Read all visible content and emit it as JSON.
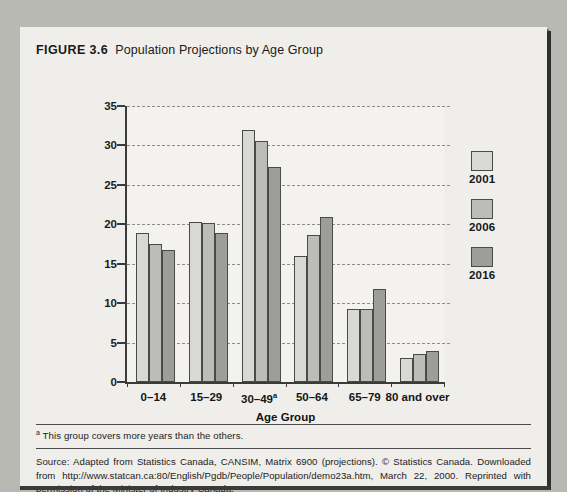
{
  "figure": {
    "number": "FIGURE 3.6",
    "title": "Population Projections by Age Group"
  },
  "footnote": {
    "marker": "a",
    "text": "This group covers more years than the others."
  },
  "source": {
    "text": "Source: Adapted from Statistics Canada, CANSIM, Matrix 6900 (projections). © Statistics Canada. Downloaded from http://www.statcan.ca:80/English/Pgdb/People/Population/demo23a.htm, March 22, 2000. Reprinted with permission of the Minister of Industry Canada."
  },
  "colors": {
    "series_2001": "#d8d8d4",
    "series_2006": "#bcbcb8",
    "series_2016": "#9d9d99",
    "bar_outline": "#4a4a4a",
    "axis": "#3b3b3b",
    "gridline": "#8d8d8d",
    "card_background": "#efeeea",
    "plot_background": "#f3f2ee",
    "page_background": "#b9b9b4"
  },
  "chart_data": {
    "type": "bar",
    "title": "Population Projections by Age Group",
    "xlabel": "Age Group",
    "ylabel": "Percentage of Total Population",
    "ylim": [
      0,
      35
    ],
    "yticks": [
      0,
      5,
      10,
      15,
      20,
      25,
      30,
      35
    ],
    "grid": true,
    "legend_position": "right",
    "categories": [
      "0–14",
      "15–29",
      "30–49ᵃ",
      "50–64",
      "65–79",
      "80 and over"
    ],
    "category_footnote_marker": {
      "30–49ᵃ": "a"
    },
    "series": [
      {
        "name": "2001",
        "color": "#d8d8d4",
        "values": [
          18.9,
          20.3,
          32.0,
          16.0,
          9.3,
          3.0
        ]
      },
      {
        "name": "2006",
        "color": "#bcbcb8",
        "values": [
          17.5,
          20.2,
          30.6,
          18.7,
          9.3,
          3.5
        ]
      },
      {
        "name": "2016",
        "color": "#9d9d99",
        "values": [
          16.8,
          18.9,
          27.3,
          20.9,
          11.8,
          3.9
        ]
      }
    ]
  }
}
